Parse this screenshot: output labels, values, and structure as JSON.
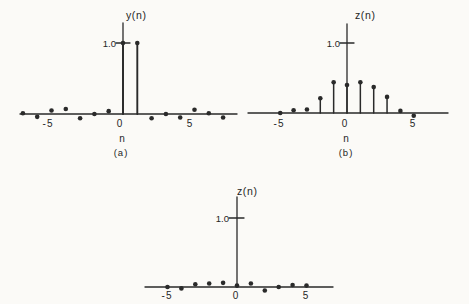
{
  "figure": {
    "background": "#fbfaf7",
    "ink": "#2a2a2a"
  },
  "chart_data": [
    {
      "id": "a",
      "type": "stem",
      "title": "",
      "ylabel": "y(n)",
      "xlabel": "n",
      "caption": "(a)",
      "ytick_label": "1.0",
      "ytick_value": 1.0,
      "xtick_labels": [
        "-5",
        "0",
        "5"
      ],
      "xtick_values": [
        -5,
        0,
        5
      ],
      "x": [
        -7,
        -6,
        -5,
        -4,
        -3,
        -2,
        -1,
        0,
        1,
        2,
        3,
        4,
        5,
        6,
        7
      ],
      "y": [
        0.01,
        -0.04,
        0.05,
        0.07,
        -0.06,
        0.0,
        0.04,
        1.0,
        1.0,
        -0.06,
        0.0,
        -0.05,
        0.06,
        0.01,
        -0.05
      ],
      "xlim": [
        -7.6,
        8.0
      ],
      "ylim": [
        -0.1,
        1.3
      ],
      "grid": false,
      "legend": false
    },
    {
      "id": "b",
      "type": "stem",
      "title": "",
      "ylabel": "z(n)",
      "xlabel": "n",
      "caption": "(b)",
      "ytick_label": "1.0",
      "ytick_value": 1.0,
      "xtick_labels": [
        "-5",
        "0",
        "5"
      ],
      "xtick_values": [
        -5,
        0,
        5
      ],
      "x": [
        -5,
        -4,
        -3,
        -2,
        -1,
        0,
        1,
        2,
        3,
        4,
        5
      ],
      "y": [
        0.0,
        0.04,
        0.05,
        0.21,
        0.44,
        0.4,
        0.44,
        0.37,
        0.23,
        0.03,
        -0.04
      ],
      "xlim": [
        -7.4,
        7.6
      ],
      "ylim": [
        -0.1,
        1.3
      ],
      "grid": false,
      "legend": false
    },
    {
      "id": "c",
      "type": "stem",
      "title": "",
      "ylabel": "z(n)",
      "xlabel": "",
      "caption": "",
      "ytick_label": "1.0",
      "ytick_value": 1.0,
      "xtick_labels": [
        "-5",
        "0",
        "5"
      ],
      "xtick_values": [
        -5,
        0,
        5
      ],
      "x": [
        -5,
        -4,
        -3,
        -2,
        -1,
        0,
        1,
        2,
        3,
        4,
        5
      ],
      "y": [
        0.0,
        -0.02,
        0.04,
        0.05,
        0.06,
        0.02,
        0.05,
        -0.05,
        0.0,
        0.03,
        0.02
      ],
      "xlim": [
        -6.6,
        7.0
      ],
      "ylim": [
        -0.1,
        1.3
      ],
      "grid": false,
      "legend": false
    }
  ]
}
